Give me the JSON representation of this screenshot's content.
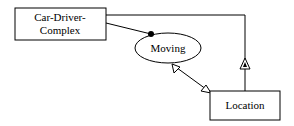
{
  "diagram": {
    "nodes": [
      {
        "id": "car-driver-complex",
        "shape": "rectangle",
        "label_lines": [
          "Car-Driver-",
          "Complex"
        ]
      },
      {
        "id": "moving",
        "shape": "ellipse",
        "label": "Moving"
      },
      {
        "id": "location",
        "shape": "rectangle",
        "label": "Location"
      }
    ],
    "edges": [
      {
        "from": "car-driver-complex",
        "to": "moving",
        "end_marker": "filled-dot"
      },
      {
        "from": "moving",
        "to": "location",
        "start_marker": "open-arrow",
        "end_marker": "open-arrow"
      },
      {
        "from": "car-driver-complex",
        "to": "location",
        "marker": "triangle-with-dot",
        "route": "top-right-elbow"
      }
    ],
    "colors": {
      "stroke": "#000000",
      "background": "#ffffff"
    }
  }
}
